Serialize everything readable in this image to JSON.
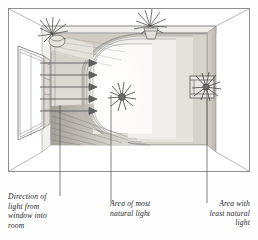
{
  "figure": {
    "frame": {
      "border_color": "#8a8a8a"
    },
    "scene": {
      "room_label": "room-interior-perspective",
      "window_label": "window-on-left-wall",
      "arrows": {
        "name": "light-direction-arrows",
        "count": 5,
        "direction": "right",
        "color": "#6b6b6b"
      },
      "light_zones": [
        {
          "name": "zone-most-light",
          "tone": "#ffffff"
        },
        {
          "name": "zone-bright",
          "tone": "#f3f2ef"
        },
        {
          "name": "zone-medium",
          "tone": "#e6e4df"
        },
        {
          "name": "zone-dim",
          "tone": "#d8d5cf"
        },
        {
          "name": "zone-least-light",
          "tone": "#c9c5bd"
        }
      ],
      "plants": [
        {
          "name": "plant-upper-left-ledge"
        },
        {
          "name": "plant-back-wall-ledge"
        },
        {
          "name": "plant-centre-floor"
        },
        {
          "name": "plant-right-wall-table"
        }
      ]
    },
    "labels": [
      {
        "id": "direction-of-light",
        "lines": [
          "Direction of",
          "light from",
          "window into",
          "room"
        ]
      },
      {
        "id": "most-natural-light",
        "lines": [
          "Area of most",
          "natural light"
        ]
      },
      {
        "id": "least-natural-light",
        "lines": [
          "Area with",
          "least natural",
          "light"
        ]
      }
    ],
    "leader_lines": [
      {
        "name": "leader-line-direction",
        "x": 60
      },
      {
        "name": "leader-line-most-light",
        "x": 111
      },
      {
        "name": "leader-line-least-light",
        "x": 207
      }
    ]
  }
}
